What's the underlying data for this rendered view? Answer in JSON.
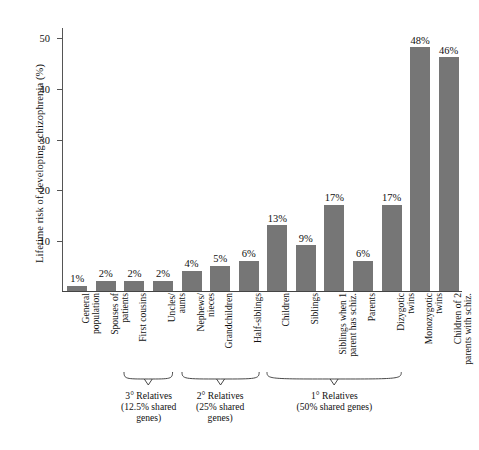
{
  "chart_data": {
    "type": "bar",
    "title": "",
    "xlabel": "",
    "ylabel": "Lifetime risk of developing schizophrenia (%)",
    "ylim": [
      0,
      52
    ],
    "yticks": [
      10,
      20,
      30,
      40,
      50
    ],
    "ytick_labels": [
      "10",
      "20",
      "30",
      "40",
      "50"
    ],
    "grid": false,
    "legend": "none",
    "bar_color": "#767676",
    "categories": [
      "General population",
      "Spouses of patients",
      "First cousins",
      "Uncles/ aunts",
      "Nephews/ nieces",
      "Grandchildren",
      "Half-siblings",
      "Children",
      "Siblings",
      "Siblings when 1 parent has schiz.",
      "Parents",
      "Dizygotic twins",
      "Monozygotic twins",
      "Children of 2 parents with schiz."
    ],
    "category_lines": [
      [
        "General",
        "population"
      ],
      [
        "Spouses of",
        "patients"
      ],
      [
        "First cousins"
      ],
      [
        "Uncles/",
        "aunts"
      ],
      [
        "Nephews/",
        "nieces"
      ],
      [
        "Grandchildren"
      ],
      [
        "Half-siblings"
      ],
      [
        "Children"
      ],
      [
        "Siblings"
      ],
      [
        "Siblings when 1",
        "parent has schiz."
      ],
      [
        "Parents"
      ],
      [
        "Dizygotic",
        "twins"
      ],
      [
        "Monozygotic",
        "twins"
      ],
      [
        "Children of 2",
        "parents with schiz."
      ]
    ],
    "values": [
      1,
      2,
      2,
      2,
      4,
      5,
      6,
      13,
      9,
      17,
      6,
      17,
      48,
      46
    ],
    "value_labels": [
      "1%",
      "2%",
      "2%",
      "2%",
      "4%",
      "5%",
      "6%",
      "13%",
      "9%",
      "17%",
      "6%",
      "17%",
      "48%",
      "46%"
    ],
    "groups": [
      {
        "id": "tertiary",
        "lines": [
          "3° Relatives",
          "(12.5% shared",
          "genes)"
        ],
        "first_index": 2,
        "last_index": 3
      },
      {
        "id": "secondary",
        "lines": [
          "2° Relatives",
          "(25% shared",
          "genes)"
        ],
        "first_index": 4,
        "last_index": 6
      },
      {
        "id": "primary",
        "lines": [
          "1° Relatives",
          "(50% shared genes)"
        ],
        "first_index": 7,
        "last_index": 11
      }
    ]
  }
}
